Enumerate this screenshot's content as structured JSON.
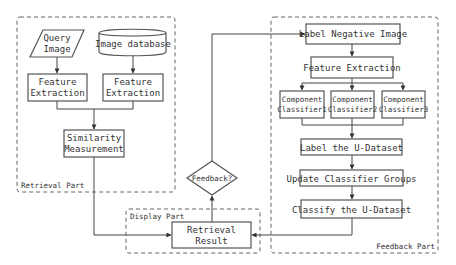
{
  "groups": {
    "retrieval": {
      "label": "Retrieval Part"
    },
    "display": {
      "label": "Display Part"
    },
    "feedback": {
      "label": "Feedback Part"
    }
  },
  "nodes": {
    "query_image": {
      "line1": "Query",
      "line2": "Image",
      "shape": "parallelogram"
    },
    "image_database": {
      "label": "Image database",
      "shape": "cylinder"
    },
    "feature_extraction_query": {
      "line1": "Feature",
      "line2": "Extraction",
      "shape": "rectangle"
    },
    "feature_extraction_db": {
      "line1": "Feature",
      "line2": "Extraction",
      "shape": "rectangle"
    },
    "similarity_measurement": {
      "line1": "Similarity",
      "line2": "Measurement",
      "shape": "rectangle"
    },
    "retrieval_result": {
      "line1": "Retrieval",
      "line2": "Result",
      "shape": "rectangle"
    },
    "feedback_decision": {
      "label": "Feedback?",
      "shape": "diamond"
    },
    "label_negative_image": {
      "label": "Label Negative Image",
      "shape": "rectangle"
    },
    "feature_extraction_fb": {
      "label": "Feature Extraction",
      "shape": "rectangle"
    },
    "component_classifier_1": {
      "line1": "Component",
      "line2": "Classifier1",
      "shape": "rectangle"
    },
    "component_classifier_2": {
      "line1": "Component",
      "line2": "Classifier2",
      "shape": "rectangle"
    },
    "component_classifier_3": {
      "line1": "Component",
      "line2": "Classifier3",
      "shape": "rectangle"
    },
    "label_u_dataset": {
      "label": "Label the U-Dataset",
      "shape": "rectangle"
    },
    "update_classifier_groups": {
      "label": "Update Classifier Groups",
      "shape": "rectangle"
    },
    "classify_u_dataset": {
      "label": "Classify the U-Dataset",
      "shape": "rectangle"
    }
  },
  "edges": [
    {
      "from": "query_image",
      "to": "feature_extraction_query"
    },
    {
      "from": "image_database",
      "to": "feature_extraction_db"
    },
    {
      "from": "feature_extraction_query",
      "to": "similarity_measurement"
    },
    {
      "from": "feature_extraction_db",
      "to": "similarity_measurement"
    },
    {
      "from": "similarity_measurement",
      "to": "retrieval_result"
    },
    {
      "from": "retrieval_result",
      "to": "feedback_decision"
    },
    {
      "from": "feedback_decision",
      "to": "label_negative_image"
    },
    {
      "from": "label_negative_image",
      "to": "feature_extraction_fb"
    },
    {
      "from": "feature_extraction_fb",
      "to": "component_classifier_1"
    },
    {
      "from": "feature_extraction_fb",
      "to": "component_classifier_2"
    },
    {
      "from": "feature_extraction_fb",
      "to": "component_classifier_3"
    },
    {
      "from": "component_classifier_1",
      "to": "label_u_dataset"
    },
    {
      "from": "component_classifier_2",
      "to": "label_u_dataset"
    },
    {
      "from": "component_classifier_3",
      "to": "label_u_dataset"
    },
    {
      "from": "label_u_dataset",
      "to": "update_classifier_groups"
    },
    {
      "from": "update_classifier_groups",
      "to": "classify_u_dataset"
    },
    {
      "from": "classify_u_dataset",
      "to": "retrieval_result"
    }
  ]
}
